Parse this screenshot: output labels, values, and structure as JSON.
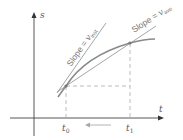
{
  "diagram": {
    "axes": {
      "y_label": "s",
      "x_label": "t"
    },
    "ticks": {
      "t0": {
        "base": "t",
        "sub": "0"
      },
      "t1": {
        "base": "t",
        "sub": "1"
      }
    },
    "annotations": {
      "tangent_label_prefix": "Slope = ",
      "tangent_label_v": "v",
      "tangent_label_sub": "inst",
      "secant_label_prefix": "Slope = ",
      "secant_label_v": "v",
      "secant_label_sub": "ave"
    },
    "arrow_direction": "t1 toward t0 (left)",
    "colors": {
      "curve": "#8a8a8a",
      "lines": "#9a9a9a",
      "axis": "#333333",
      "dashed": "#aaaaaa"
    }
  }
}
